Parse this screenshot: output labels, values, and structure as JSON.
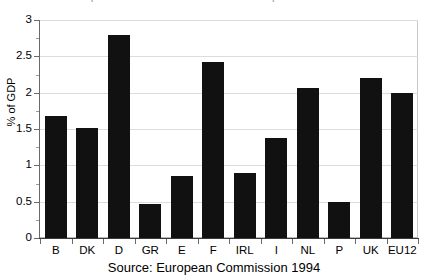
{
  "chart_data": {
    "type": "bar",
    "title": "",
    "title_clipped_remnant": "expenditure on active labour market policies",
    "xlabel": "",
    "ylabel": "% of GDP",
    "ylim": [
      0,
      3
    ],
    "ytick_labels": [
      "0",
      "0.5",
      "1",
      "1.5",
      "2",
      "2.5",
      "3"
    ],
    "ytick_values": [
      0,
      0.5,
      1,
      1.5,
      2,
      2.5,
      3
    ],
    "yminor_step": 0.25,
    "grid": true,
    "legend": null,
    "categories": [
      "B",
      "DK",
      "D",
      "GR",
      "E",
      "F",
      "IRL",
      "I",
      "NL",
      "P",
      "UK",
      "EU12"
    ],
    "values": [
      1.68,
      1.52,
      2.8,
      0.47,
      0.86,
      2.42,
      0.9,
      1.37,
      2.06,
      0.49,
      2.2,
      2.0
    ],
    "bar_color": "#111111",
    "grid_color": "#dcdcdc",
    "source": "Source: European Commission 1994"
  },
  "axis": {
    "y_title": "% of GDP"
  },
  "caption": {
    "source_text": "Source: European Commission 1994"
  }
}
